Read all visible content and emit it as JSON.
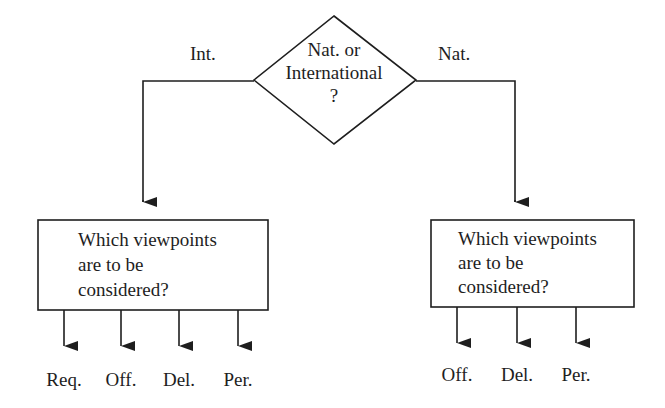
{
  "decision": {
    "line1": "Nat. or",
    "line2": "International",
    "line3": "?",
    "left_branch_label": "Int.",
    "right_branch_label": "Nat."
  },
  "left_box": {
    "line1": "Which viewpoints",
    "line2": "are to be",
    "line3": "considered?",
    "outputs": [
      "Req.",
      "Off.",
      "Del.",
      "Per."
    ]
  },
  "right_box": {
    "line1": "Which viewpoints",
    "line2": "are to be",
    "line3": "considered?",
    "outputs": [
      "Off.",
      "Del.",
      "Per."
    ]
  },
  "colors": {
    "stroke": "#1e1e1e",
    "background": "#ffffff"
  }
}
